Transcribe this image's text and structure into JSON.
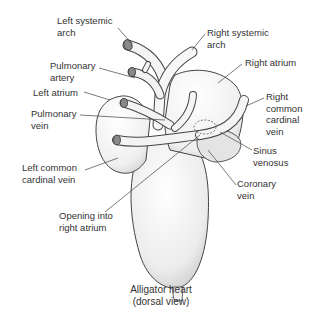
{
  "figure": {
    "caption": {
      "line1": "Alligator heart",
      "line2": "(dorsal view)"
    },
    "labels": {
      "left_systemic_arch": {
        "line1": "Left systemic",
        "line2": "arch"
      },
      "pulmonary_artery": {
        "line1": "Pulmonary",
        "line2": "artery"
      },
      "left_atrium": {
        "line1": "Left atrium"
      },
      "pulmonary_vein": {
        "line1": "Pulmonary",
        "line2": "vein"
      },
      "left_common_cardinal_vein": {
        "line1": "Left common",
        "line2": "cardinal vein"
      },
      "opening_into_right_atrium": {
        "line1": "Opening into",
        "line2": "right atrium"
      },
      "right_systemic_arch": {
        "line1": "Right systemic",
        "line2": "arch"
      },
      "right_atrium": {
        "line1": "Right atrium"
      },
      "right_common_cardinal_vein": {
        "line1": "Right",
        "line2": "common",
        "line3": "cardinal",
        "line4": "vein"
      },
      "sinus_venosus": {
        "line1": "Sinus",
        "line2": "venosus"
      },
      "coronary_vein": {
        "line1": "Coronary",
        "line2": "vein"
      }
    },
    "colors": {
      "ink": "#333333",
      "stipple": "#d9d9d9",
      "background": "#ffffff"
    }
  }
}
